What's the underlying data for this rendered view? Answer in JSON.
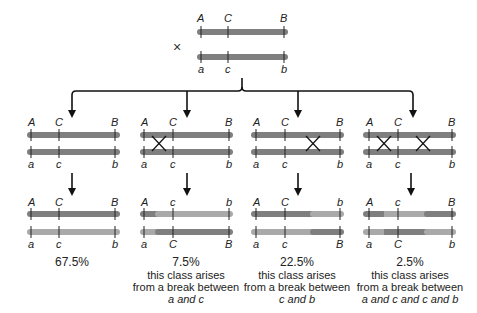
{
  "parental": {
    "cross_symbol": "×",
    "top": {
      "labels": [
        "A",
        "C",
        "B"
      ]
    },
    "bottom": {
      "labels": [
        "a",
        "c",
        "b"
      ]
    }
  },
  "colors": {
    "chromosome_dark": "#7f7f7f",
    "chromosome_light": "#a9a9a9",
    "line": "#222222"
  },
  "meiosis_row": [
    {
      "id": "no-crossover",
      "top_labels": [
        "A",
        "C",
        "B"
      ],
      "bottom_labels": [
        "a",
        "c",
        "b"
      ],
      "crossovers": []
    },
    {
      "id": "crossover-a-c",
      "top_labels": [
        "A",
        "C",
        "B"
      ],
      "bottom_labels": [
        "a",
        "c",
        "b"
      ],
      "crossovers": [
        "between a and c"
      ]
    },
    {
      "id": "crossover-c-b",
      "top_labels": [
        "A",
        "C",
        "B"
      ],
      "bottom_labels": [
        "a",
        "c",
        "b"
      ],
      "crossovers": [
        "between c and b"
      ]
    },
    {
      "id": "double-crossover",
      "top_labels": [
        "A",
        "C",
        "B"
      ],
      "bottom_labels": [
        "a",
        "c",
        "b"
      ],
      "crossovers": [
        "between a and c",
        "between c and b"
      ]
    }
  ],
  "products_row": [
    {
      "top_labels": [
        "A",
        "C",
        "B"
      ],
      "bottom_labels": [
        "a",
        "c",
        "b"
      ],
      "percent": "67.5%",
      "note_lines": []
    },
    {
      "top_labels": [
        "A",
        "c",
        "b"
      ],
      "bottom_labels": [
        "a",
        "C",
        "B"
      ],
      "percent": "7.5%",
      "note_lines": [
        "this class arises",
        "from a break between"
      ],
      "note_italic": "a and c"
    },
    {
      "top_labels": [
        "A",
        "C",
        "b"
      ],
      "bottom_labels": [
        "a",
        "c",
        "B"
      ],
      "percent": "22.5%",
      "note_lines": [
        "this class arises",
        "from a break between"
      ],
      "note_italic": "c and b"
    },
    {
      "top_labels": [
        "A",
        "c",
        "B"
      ],
      "bottom_labels": [
        "a",
        "C",
        "b"
      ],
      "percent": "2.5%",
      "note_lines": [
        "this class arises",
        "from a break between"
      ],
      "note_italic": "a and c and c and b"
    }
  ]
}
